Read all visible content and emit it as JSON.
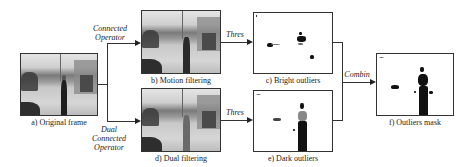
{
  "figure": {
    "panels": {
      "a": {
        "caption": "a) Original frame"
      },
      "b": {
        "caption": "b) Motion filtering"
      },
      "c": {
        "caption": "c) Bright outliers"
      },
      "d": {
        "caption": "d) Dual filtering"
      },
      "e": {
        "caption": "e) Dark outliers"
      },
      "f": {
        "caption": "f) Outliers mask"
      }
    },
    "operators": {
      "top": [
        "Connected",
        "Operator"
      ],
      "bottom": [
        "Dual",
        "Connected",
        "Operator"
      ],
      "thres_top": "Thres",
      "thres_bottom": "Thres",
      "combine": "Combin"
    }
  }
}
